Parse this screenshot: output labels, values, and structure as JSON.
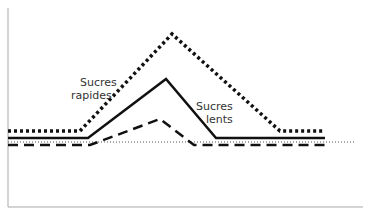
{
  "chart_data": {
    "type": "line",
    "title": "",
    "xlabel": "",
    "ylabel": "",
    "grid": false,
    "legend": "inline annotations",
    "x": [
      0,
      1,
      2,
      3,
      4,
      5
    ],
    "series": [
      {
        "name": "Sucres rapides",
        "style": "dotted",
        "points": [
          [
            8,
            131
          ],
          [
            80,
            131
          ],
          [
            172,
            34
          ],
          [
            280,
            131
          ],
          [
            325,
            131
          ]
        ]
      },
      {
        "name": "Sucres lents",
        "style": "solid",
        "points": [
          [
            8,
            138
          ],
          [
            88,
            138
          ],
          [
            166,
            79
          ],
          [
            216,
            138
          ],
          [
            325,
            138
          ]
        ]
      },
      {
        "name": "Reference (dashed)",
        "style": "dashed",
        "points": [
          [
            8,
            145
          ],
          [
            90,
            145
          ],
          [
            160,
            119
          ],
          [
            194,
            145
          ],
          [
            325,
            145
          ]
        ]
      },
      {
        "name": "Baseline",
        "style": "thin-dotted",
        "points": [
          [
            8,
            142
          ],
          [
            355,
            142
          ]
        ]
      }
    ],
    "annotations": [
      {
        "text": "Sucres rapides",
        "near": "dotted line rising edge"
      },
      {
        "text": "Sucres lents",
        "near": "solid line falling edge"
      }
    ]
  },
  "labels": {
    "rapides_line1": "Sucres",
    "rapides_line2": "rapides",
    "lents_line1": "Sucres",
    "lents_line2": "lents"
  }
}
